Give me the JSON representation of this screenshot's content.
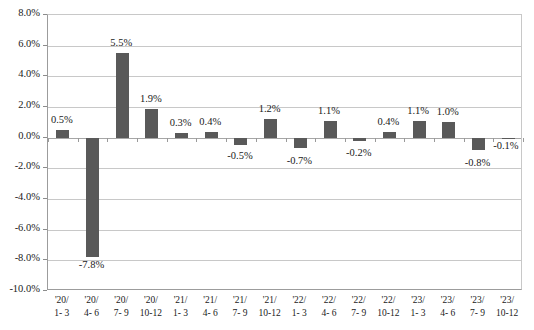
{
  "chart_data": {
    "type": "bar",
    "title": "",
    "subtitle": "",
    "xlabel": "",
    "ylabel": "",
    "ylim": [
      -10.0,
      8.0
    ],
    "ytick_step": 2.0,
    "yticks": [
      "8.0%",
      "6.0%",
      "4.0%",
      "2.0%",
      "0.0%",
      "-2.0%",
      "-4.0%",
      "-6.0%",
      "-8.0%",
      "-10.0%"
    ],
    "ytick_values": [
      8.0,
      6.0,
      4.0,
      2.0,
      0.0,
      -2.0,
      -4.0,
      -6.0,
      -8.0,
      -10.0
    ],
    "grid": true,
    "legend": false,
    "legend_position": "none",
    "bar_color": "#595959",
    "gridline_color": "#c8c8c8",
    "axis_color": "#9c9c9c",
    "categories": [
      {
        "line1": "'20/",
        "line2": "1- 3"
      },
      {
        "line1": "'20/",
        "line2": "4- 6"
      },
      {
        "line1": "'20/",
        "line2": "7- 9"
      },
      {
        "line1": "'20/",
        "line2": "10-12"
      },
      {
        "line1": "'21/",
        "line2": "1- 3"
      },
      {
        "line1": "'21/",
        "line2": "4- 6"
      },
      {
        "line1": "'21/",
        "line2": "7- 9"
      },
      {
        "line1": "'21/",
        "line2": "10-12"
      },
      {
        "line1": "'22/",
        "line2": "1- 3"
      },
      {
        "line1": "'22/",
        "line2": "4- 6"
      },
      {
        "line1": "'22/",
        "line2": "7- 9"
      },
      {
        "line1": "'22/",
        "line2": "10-12"
      },
      {
        "line1": "'23/",
        "line2": "1- 3"
      },
      {
        "line1": "'23/",
        "line2": "4- 6"
      },
      {
        "line1": "'23/",
        "line2": "7- 9"
      },
      {
        "line1": "'23/",
        "line2": "10-12"
      }
    ],
    "values": [
      0.5,
      -7.8,
      5.5,
      1.9,
      0.3,
      0.4,
      -0.5,
      1.2,
      -0.7,
      1.1,
      -0.2,
      0.4,
      1.1,
      1.0,
      -0.8,
      -0.1
    ],
    "labels": [
      "0.5%",
      "-7.8%",
      "5.5%",
      "1.9%",
      "0.3%",
      "0.4%",
      "-0.5%",
      "1.2%",
      "-0.7%",
      "1.1%",
      "-0.2%",
      "0.4%",
      "1.1%",
      "1.0%",
      "-0.8%",
      "-0.1%"
    ]
  }
}
